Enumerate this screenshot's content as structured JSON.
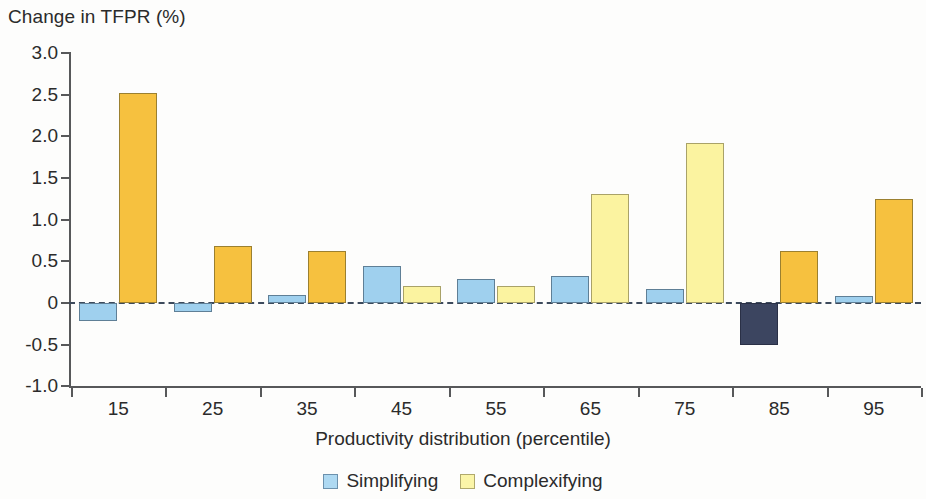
{
  "chart_data": {
    "type": "bar",
    "title": "Change in TFPR (%)",
    "xlabel": "Productivity distribution (percentile)",
    "ylabel": "Change in TFPR (%)",
    "categories": [
      "15",
      "25",
      "35",
      "45",
      "55",
      "65",
      "75",
      "85",
      "95"
    ],
    "ylim": [
      -1.0,
      3.0
    ],
    "ytick_labels": [
      "3.0",
      "2.5",
      "2.0",
      "1.5",
      "1.0",
      "0.5",
      "0",
      "-0.5",
      "-1.0"
    ],
    "ytick_values": [
      3.0,
      2.5,
      2.0,
      1.5,
      1.0,
      0.5,
      0,
      -0.5,
      -1.0
    ],
    "grid": false,
    "legend_position": "bottom",
    "zero_line": true,
    "series": [
      {
        "name": "Simplifying",
        "color": "#aed9f2",
        "values": [
          -0.22,
          -0.11,
          0.1,
          0.44,
          0.29,
          0.33,
          0.17,
          -0.5,
          0.08
        ],
        "bar_colors": [
          "#9fd0ee",
          "#9fd0ee",
          "#9fd0ee",
          "#9fd0ee",
          "#9fd0ee",
          "#9fd0ee",
          "#9fd0ee",
          "#3c4560",
          "#9fd0ee"
        ]
      },
      {
        "name": "Complexifying",
        "color": "#fbf5a8",
        "values": [
          2.52,
          0.68,
          0.62,
          0.21,
          0.21,
          1.31,
          1.92,
          0.62,
          1.25
        ],
        "bar_colors": [
          "#f6c13f",
          "#f6c13f",
          "#f6c13f",
          "#fbf3a0",
          "#fbf3a0",
          "#fbf3a0",
          "#fbf3a0",
          "#f6c13f",
          "#f6c13f"
        ]
      }
    ]
  },
  "title": "Change in TFPR (%)",
  "axis": {
    "x_caption": "Productivity distribution (percentile)"
  },
  "legend": {
    "items": [
      {
        "label": "Simplifying",
        "swatch": "blue"
      },
      {
        "label": "Complexifying",
        "swatch": "paleyellow"
      }
    ]
  }
}
